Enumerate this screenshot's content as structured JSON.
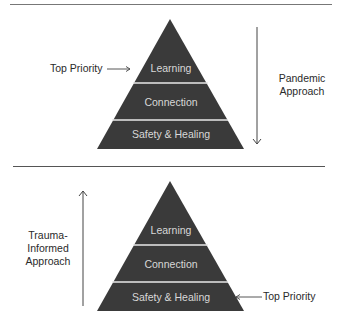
{
  "colors": {
    "pyramid_fill": "#3a3a3a",
    "layer_separator": "#e8e8e8",
    "layer_text": "#d8d8d8",
    "line": "#555555",
    "text": "#2a2a2a"
  },
  "top_panel": {
    "layers": [
      {
        "label": "Learning"
      },
      {
        "label": "Connection"
      },
      {
        "label": "Safety & Healing"
      }
    ],
    "priority_label": "Top Priority",
    "priority_points_to": "Learning",
    "approach_label_line1": "Pandemic",
    "approach_label_line2": "Approach",
    "approach_arrow_direction": "down"
  },
  "bottom_panel": {
    "layers": [
      {
        "label": "Learning"
      },
      {
        "label": "Connection"
      },
      {
        "label": "Safety & Healing"
      }
    ],
    "priority_label": "Top Priority",
    "priority_points_to": "Safety & Healing",
    "approach_label_line1": "Trauma-",
    "approach_label_line2": "Informed",
    "approach_label_line3": "Approach",
    "approach_arrow_direction": "up"
  }
}
